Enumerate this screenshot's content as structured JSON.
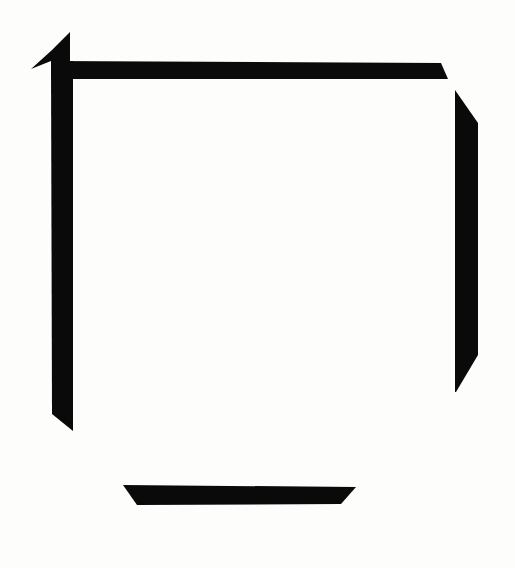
{
  "artwork": {
    "title": "Incomplete Square Frame",
    "medium_style": "abstract-minimalist-brushstroke",
    "canvas": {
      "width": 515,
      "height": 568,
      "background_color": "#fdfdfc"
    },
    "palette": {
      "ink": "#0a0a0a",
      "background": "#fdfdfc",
      "paper_tint": "#fbfbf9"
    },
    "strokes": [
      {
        "name": "top-left-wedge",
        "description": "triangular arrow-like wedge pointing down-left at the upper-left corner",
        "color": "#0a0a0a",
        "points": "70,32 70,61 51,61 31,69 52,50"
      },
      {
        "name": "top-horizontal-bar",
        "description": "long horizontal bar across the top, tapering to a point at its right end",
        "color": "#0a0a0a",
        "points": "51,61 441,63 448,79 51,79"
      },
      {
        "name": "left-vertical-bar",
        "description": "vertical bar down the left side, angled cut at the bottom-left",
        "color": "#0a0a0a",
        "points": "51,61 73,61 73,431 52,414"
      },
      {
        "name": "right-vertical-bar",
        "description": "vertical bar down the right side, narrow pointed top and angled cut bottom",
        "color": "#0a0a0a",
        "points": "455,90 478,123 478,355 456,392 455,392"
      },
      {
        "name": "bottom-horizontal-bar",
        "description": "short trapezoidal bar near the bottom, angled inward at both ends",
        "color": "#0a0a0a",
        "points": "123,485 356,487 341,504 137,505"
      }
    ]
  }
}
